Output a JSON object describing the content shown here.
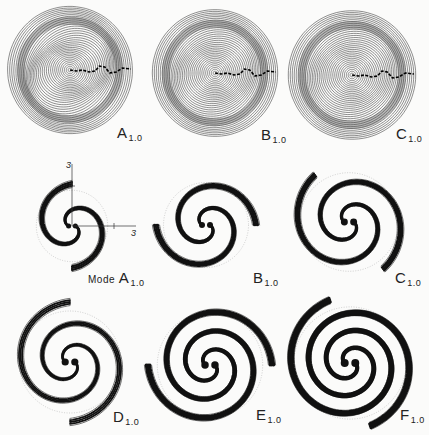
{
  "figure": {
    "top_row": [
      {
        "id": "A",
        "letter": "A",
        "sub": "1.0",
        "label": "A1.0",
        "cx": 70,
        "cy": 70,
        "r": 63
      },
      {
        "id": "B",
        "letter": "B",
        "sub": "1.0",
        "label": "B1.0",
        "cx": 215,
        "cy": 73,
        "r": 63
      },
      {
        "id": "C",
        "letter": "C",
        "sub": "1.0",
        "label": "C1.0",
        "cx": 352,
        "cy": 75,
        "r": 64
      }
    ],
    "middle_row": [
      {
        "id": "A",
        "letter": "A",
        "sub": "1.0",
        "prefix": "Mode",
        "label": "Mode A1.0",
        "cx": 72,
        "cy": 226,
        "r": 36,
        "arms": 2,
        "axes": {
          "x_tick": "3",
          "y_tick": "3"
        }
      },
      {
        "id": "B",
        "letter": "B",
        "sub": "1.0",
        "label": "B1.0",
        "cx": 206,
        "cy": 225,
        "r": 50,
        "arms": 2
      },
      {
        "id": "C",
        "letter": "C",
        "sub": "1.0",
        "label": "C1.0",
        "cx": 349,
        "cy": 222,
        "r": 58,
        "arms": 2
      }
    ],
    "bottom_row": [
      {
        "id": "D",
        "letter": "D",
        "sub": "1.0",
        "label": "D1.0",
        "cx": 70,
        "cy": 362,
        "r": 60,
        "arms": 2
      },
      {
        "id": "E",
        "letter": "E",
        "sub": "1.0",
        "label": "E1.0",
        "cx": 210,
        "cy": 365,
        "r": 62,
        "arms": 2
      },
      {
        "id": "F",
        "letter": "F",
        "sub": "1.0",
        "label": "F1.0",
        "cx": 350,
        "cy": 363,
        "r": 66,
        "arms": 2
      }
    ]
  }
}
